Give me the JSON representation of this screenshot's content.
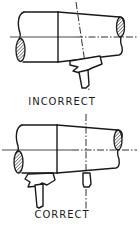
{
  "diagram": {
    "panels": [
      {
        "label": "INCORRECT",
        "description": "Tapered shaft with tool positioned under the taper, tool axis tilted"
      },
      {
        "label": "CORRECT",
        "description": "Tapered shaft with tool positioned under the straight section, vertical reference axis"
      }
    ],
    "colors": {
      "line": "#1a1a1a",
      "background": "#ffffff"
    }
  }
}
